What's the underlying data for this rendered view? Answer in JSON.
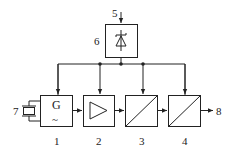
{
  "diagram": {
    "type": "block-diagram",
    "stroke_color": "#222222",
    "background": "#ffffff",
    "blocks": [
      {
        "id": "1",
        "label": "1",
        "kind": "generator",
        "symbol_text": "G",
        "symbol_sub": "~"
      },
      {
        "id": "2",
        "label": "2",
        "kind": "amplifier"
      },
      {
        "id": "3",
        "label": "3",
        "kind": "converter"
      },
      {
        "id": "4",
        "label": "4",
        "kind": "converter"
      },
      {
        "id": "6",
        "label": "6",
        "kind": "power-supply-zener"
      }
    ],
    "terminals": {
      "input_power": "5",
      "crystal": "7",
      "output": "8"
    },
    "connections": [
      {
        "from": "5",
        "to": "6"
      },
      {
        "from": "6",
        "to": "1"
      },
      {
        "from": "6",
        "to": "2"
      },
      {
        "from": "6",
        "to": "3"
      },
      {
        "from": "6",
        "to": "4"
      },
      {
        "from": "7",
        "to": "1"
      },
      {
        "from": "1",
        "to": "2"
      },
      {
        "from": "2",
        "to": "3"
      },
      {
        "from": "3",
        "to": "4"
      },
      {
        "from": "4",
        "to": "8"
      }
    ]
  }
}
